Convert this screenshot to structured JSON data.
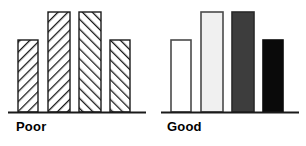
{
  "figure": {
    "width": 306,
    "height": 146,
    "background": "#ffffff",
    "ink_color": "#1a1a1a"
  },
  "panels": [
    {
      "id": "poor",
      "label": "Poor",
      "fill_style": "diagonal-hatch",
      "baseline_y": 112,
      "axis_x_start": 8,
      "axis_x_end": 146
    },
    {
      "id": "good",
      "label": "Good",
      "fill_style": "grayscale",
      "baseline_y": 112,
      "axis_x_start": 8,
      "axis_x_end": 146
    }
  ],
  "chart_data": [
    {
      "type": "bar",
      "title": "Poor",
      "xlabel": "",
      "ylabel": "",
      "categories": [
        "1",
        "2",
        "3",
        "4"
      ],
      "values": [
        72,
        100,
        100,
        72
      ],
      "ylim": [
        0,
        104
      ],
      "grid": false,
      "legend": "none",
      "bar_fills": [
        "diagonal-hatch-backward",
        "diagonal-hatch-backward",
        "diagonal-hatch-forward",
        "diagonal-hatch-forward"
      ],
      "bar_edge_color": "#1a1a1a",
      "bar_geometry": [
        {
          "x": 18,
          "width": 20,
          "top": 40,
          "bottom": 112
        },
        {
          "x": 48,
          "width": 22,
          "top": 12,
          "bottom": 112
        },
        {
          "x": 79,
          "width": 22,
          "top": 12,
          "bottom": 112
        },
        {
          "x": 110,
          "width": 20,
          "top": 40,
          "bottom": 112
        }
      ],
      "annotation": "All four bars use the same busy diagonal hatch, so the bars are hard to tell apart and shimmer."
    },
    {
      "type": "bar",
      "title": "Good",
      "xlabel": "",
      "ylabel": "",
      "categories": [
        "1",
        "2",
        "3",
        "4"
      ],
      "values": [
        72,
        100,
        100,
        72
      ],
      "ylim": [
        0,
        104
      ],
      "grid": false,
      "legend": "none",
      "bar_fills": [
        "#ffffff",
        "#f0f0f0",
        "#3d3d3d",
        "#0a0a0a"
      ],
      "bar_fill_names": [
        "white",
        "light-gray",
        "dark-gray",
        "black"
      ],
      "bar_edge_color": "#1a1a1a",
      "bar_geometry": [
        {
          "x": 18,
          "width": 20,
          "top": 40,
          "bottom": 112
        },
        {
          "x": 48,
          "width": 22,
          "top": 12,
          "bottom": 112
        },
        {
          "x": 79,
          "width": 22,
          "top": 12,
          "bottom": 112
        },
        {
          "x": 110,
          "width": 20,
          "top": 40,
          "bottom": 112
        }
      ],
      "annotation": "Distinct flat gray values separate the bars cleanly."
    }
  ]
}
